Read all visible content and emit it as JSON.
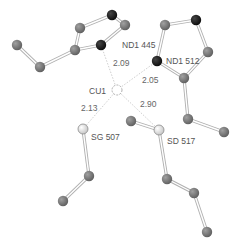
{
  "diagram": {
    "type": "molecular-coordination",
    "center_atom": "CU1",
    "colors": {
      "carbon": "#7a7a7a",
      "nitrogen": "#1a1a1a",
      "sulfur": "#f2f2f2",
      "copper": "#ffffff",
      "bond": "#bbbbbb",
      "coord_line": "#cfcfcf",
      "text": "#555555"
    },
    "labels": {
      "cu": "CU1",
      "nd1_445": "ND1 445",
      "nd1_512": "ND1 512",
      "sg_507": "SG 507",
      "sd_517": "SD 517"
    },
    "distances": {
      "cu_nd1_445": "2.09",
      "cu_nd1_512": "2.05",
      "cu_sg_507": "2.13",
      "cu_sd_517": "2.90"
    },
    "atoms": [
      {
        "id": "a1",
        "el": "C",
        "x": 17,
        "y": 45
      },
      {
        "id": "a2",
        "el": "C",
        "x": 40,
        "y": 67
      },
      {
        "id": "a3",
        "el": "C",
        "x": 75,
        "y": 50
      },
      {
        "id": "a4",
        "el": "C",
        "x": 80,
        "y": 28
      },
      {
        "id": "a5",
        "el": "N",
        "x": 112,
        "y": 15
      },
      {
        "id": "a6",
        "el": "C",
        "x": 125,
        "y": 25
      },
      {
        "id": "a7",
        "el": "N",
        "x": 101,
        "y": 45
      },
      {
        "id": "b1",
        "el": "C",
        "x": 165,
        "y": 25
      },
      {
        "id": "b2",
        "el": "N",
        "x": 196,
        "y": 20
      },
      {
        "id": "b3",
        "el": "C",
        "x": 208,
        "y": 52
      },
      {
        "id": "b4",
        "el": "C",
        "x": 184,
        "y": 78
      },
      {
        "id": "b5",
        "el": "N",
        "x": 157,
        "y": 61
      },
      {
        "id": "b6",
        "el": "C",
        "x": 188,
        "y": 119
      },
      {
        "id": "b7",
        "el": "C",
        "x": 224,
        "y": 132
      },
      {
        "id": "s1",
        "el": "S",
        "x": 83,
        "y": 129
      },
      {
        "id": "s2",
        "el": "C",
        "x": 89,
        "y": 176
      },
      {
        "id": "s3",
        "el": "C",
        "x": 63,
        "y": 201
      },
      {
        "id": "d1",
        "el": "C",
        "x": 131,
        "y": 121
      },
      {
        "id": "d2",
        "el": "S",
        "x": 159,
        "y": 130
      },
      {
        "id": "d3",
        "el": "C",
        "x": 167,
        "y": 179
      },
      {
        "id": "d4",
        "el": "C",
        "x": 194,
        "y": 193
      },
      {
        "id": "d5",
        "el": "C",
        "x": 207,
        "y": 232
      },
      {
        "id": "cu",
        "el": "Cu",
        "x": 117,
        "y": 90
      }
    ],
    "bonds": [
      [
        "a1",
        "a2"
      ],
      [
        "a2",
        "a3"
      ],
      [
        "a3",
        "a4"
      ],
      [
        "a4",
        "a5"
      ],
      [
        "a5",
        "a6"
      ],
      [
        "a6",
        "a7"
      ],
      [
        "a7",
        "a3"
      ],
      [
        "b1",
        "b2"
      ],
      [
        "b2",
        "b3"
      ],
      [
        "b3",
        "b4"
      ],
      [
        "b4",
        "b5"
      ],
      [
        "b5",
        "b1"
      ],
      [
        "b4",
        "b6"
      ],
      [
        "b6",
        "b7"
      ],
      [
        "s1",
        "s2"
      ],
      [
        "s2",
        "s3"
      ],
      [
        "d1",
        "d2"
      ],
      [
        "d2",
        "d3"
      ],
      [
        "d3",
        "d4"
      ],
      [
        "d4",
        "d5"
      ]
    ],
    "coordination": [
      [
        "cu",
        "a7"
      ],
      [
        "cu",
        "b5"
      ],
      [
        "cu",
        "s1"
      ],
      [
        "cu",
        "d2"
      ]
    ]
  }
}
